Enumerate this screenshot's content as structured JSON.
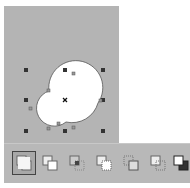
{
  "canvas": {
    "background": "#b4b4b4"
  },
  "shape": {
    "type": "welded-circles",
    "fill": "#ffffff",
    "stroke": "#555555"
  },
  "selection": {
    "handle_color": "#333333",
    "center_marker": "x-icon"
  },
  "toolbar": {
    "buttons": [
      {
        "name": "weld-button",
        "icon": "weld-icon",
        "active": true
      },
      {
        "name": "trim-button",
        "icon": "trim-icon",
        "active": false
      },
      {
        "name": "intersect-button",
        "icon": "intersect-icon",
        "active": false
      },
      {
        "name": "simplify-button",
        "icon": "simplify-icon",
        "active": false
      },
      {
        "name": "front-minus-back-button",
        "icon": "front-minus-back-icon",
        "active": false
      },
      {
        "name": "back-minus-front-button",
        "icon": "back-minus-front-icon",
        "active": false
      },
      {
        "name": "boundary-button",
        "icon": "boundary-icon",
        "active": false
      }
    ]
  }
}
